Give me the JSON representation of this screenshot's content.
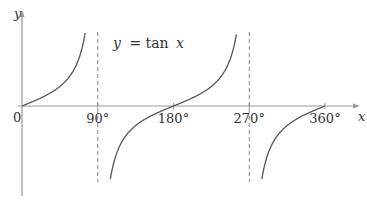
{
  "chart_data": {
    "type": "line",
    "title": "",
    "annotation": "y = tan x",
    "annotation_parts": {
      "y": "y",
      "eq": "= tan",
      "x": "x"
    },
    "xlabel": "x",
    "ylabel": "y",
    "origin_label": "0",
    "x_ticks": [
      {
        "value": 90,
        "label": "90°"
      },
      {
        "value": 180,
        "label": "180°"
      },
      {
        "value": 270,
        "label": "270°"
      },
      {
        "value": 360,
        "label": "360°"
      }
    ],
    "xlim": [
      0,
      360
    ],
    "asymptotes_x": [
      90,
      270
    ],
    "series": [
      {
        "name": "tan x",
        "function": "tan(x)",
        "domain_deg": [
          0,
          360
        ]
      }
    ],
    "grid": false,
    "legend": null
  },
  "style": {
    "axis_color": "#999999",
    "curve_color": "#555555",
    "asymptote_color": "#888888",
    "text_color": "#333333"
  }
}
